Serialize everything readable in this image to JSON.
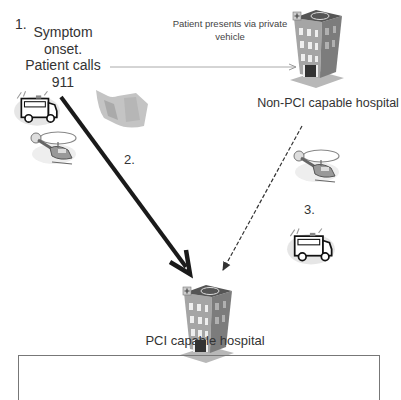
{
  "diagram": {
    "step1_number": "1.",
    "step1_text": [
      "Symptom",
      "onset.",
      "Patient calls",
      "911"
    ],
    "private_vehicle_label": [
      "Patient presents via private",
      "vehicle"
    ],
    "non_pci_hospital_label": "Non-PCI capable hospital",
    "step2_number": "2.",
    "step3_number": "3.",
    "pci_hospital_label": "PCI capable hospital",
    "colors": {
      "text": "#333333",
      "thick_arrow": "#1a1a1a",
      "dashed_arrow": "#333333",
      "private_arrow": "#aaaaaa",
      "building": "#9a9a9a"
    }
  }
}
